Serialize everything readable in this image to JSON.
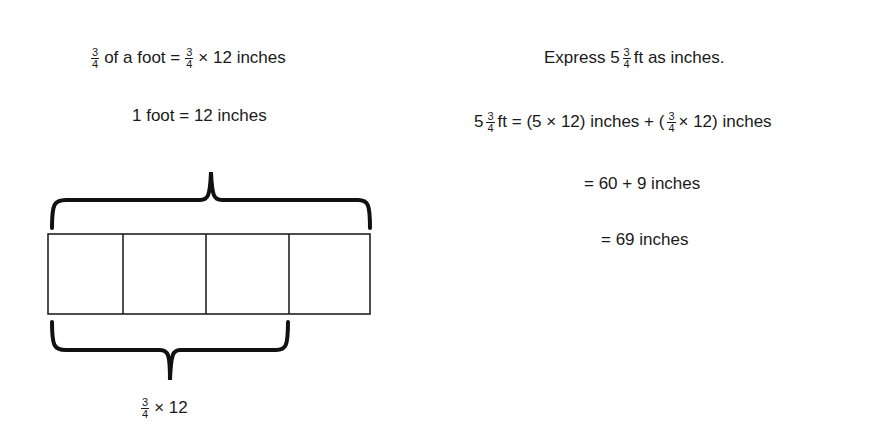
{
  "left": {
    "line1": {
      "frac1": {
        "num": "3",
        "den": "4"
      },
      "text1": "of a foot =",
      "frac2": {
        "num": "3",
        "den": "4"
      },
      "text2": "× 12 inches"
    },
    "line2": "1 foot = 12 inches",
    "tape_diagram": {
      "units": 4,
      "shaded_units": 0,
      "top_brace": "whole (1 foot)",
      "bottom_brace_units": 3
    },
    "bottom_label": {
      "frac": {
        "num": "3",
        "den": "4"
      },
      "text": "× 12"
    }
  },
  "right": {
    "title": {
      "text1": "Express 5",
      "frac": {
        "num": "3",
        "den": "4"
      },
      "text2": "ft as inches."
    },
    "step1": {
      "whole": "5",
      "frac1": {
        "num": "3",
        "den": "4"
      },
      "text1": "ft = (5 × 12) inches + (",
      "frac2": {
        "num": "3",
        "den": "4"
      },
      "text2": "× 12) inches"
    },
    "step2": "= 60 + 9 inches",
    "step3": "= 69 inches"
  }
}
